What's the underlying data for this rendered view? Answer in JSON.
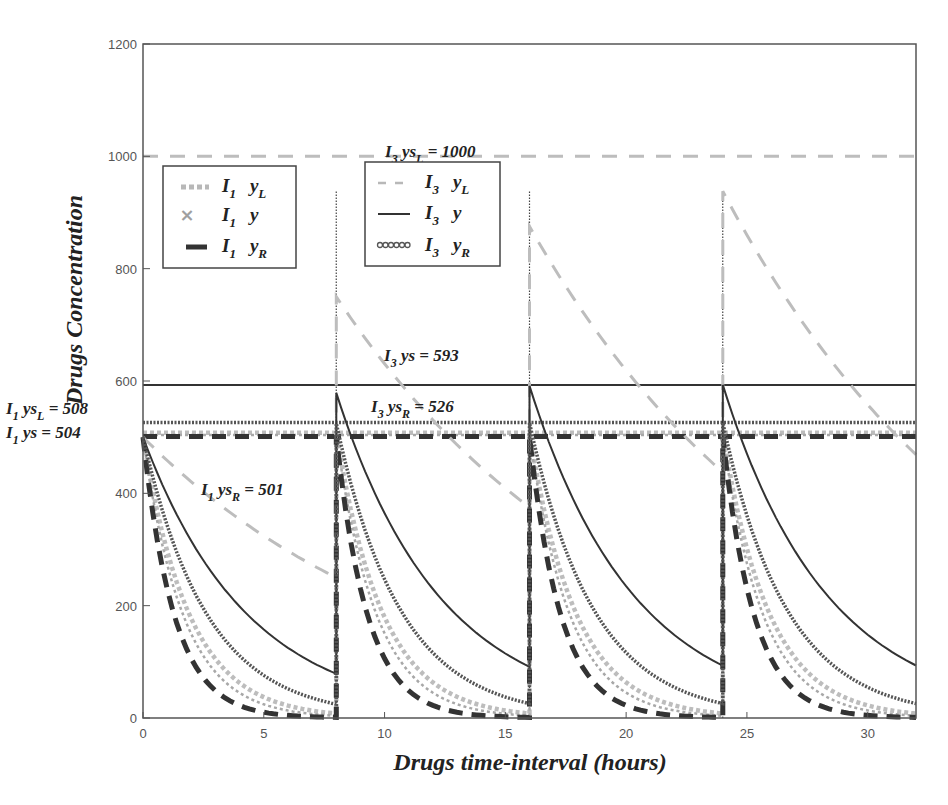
{
  "chart_data": {
    "type": "line",
    "title": "",
    "xlabel": "Drugs time-interval (hours)",
    "ylabel": "Drugs Concentration",
    "xlim": [
      0,
      32
    ],
    "ylim": [
      0,
      1200
    ],
    "xticks": [
      0,
      5,
      10,
      15,
      20,
      25,
      30
    ],
    "yticks": [
      0,
      200,
      400,
      600,
      800,
      1000,
      1200
    ],
    "grid": false,
    "dosing_times": [
      0,
      8,
      16,
      24
    ],
    "series": [
      {
        "name": "I1 yL",
        "style": "dotted-thick",
        "color": "#b8b8b8",
        "dose": 500,
        "k": 0.52,
        "steady_state": 508,
        "points": [
          [
            0,
            500
          ],
          [
            2,
            177
          ],
          [
            4,
            62
          ],
          [
            6,
            22
          ],
          [
            8,
            8
          ],
          [
            8,
            508
          ],
          [
            16,
            8
          ],
          [
            16,
            508
          ],
          [
            24,
            8
          ],
          [
            24,
            508
          ],
          [
            32,
            8
          ]
        ]
      },
      {
        "name": "I1 y",
        "style": "x-markers",
        "color": "#a0a0a0",
        "dose": 500,
        "k": 0.604,
        "steady_state": 504,
        "points": [
          [
            0,
            500
          ],
          [
            2,
            149
          ],
          [
            4,
            45
          ],
          [
            6,
            13
          ],
          [
            8,
            4
          ],
          [
            8,
            504
          ],
          [
            16,
            4
          ],
          [
            16,
            504
          ],
          [
            24,
            4
          ],
          [
            24,
            504
          ],
          [
            32,
            4
          ]
        ]
      },
      {
        "name": "I1 yR",
        "style": "dashed-thick",
        "color": "#333333",
        "dose": 500,
        "k": 0.777,
        "steady_state": 501,
        "points": [
          [
            0,
            500
          ],
          [
            2,
            106
          ],
          [
            4,
            22
          ],
          [
            6,
            5
          ],
          [
            8,
            1
          ],
          [
            8,
            501
          ],
          [
            16,
            1
          ],
          [
            16,
            501
          ],
          [
            24,
            1
          ],
          [
            24,
            501
          ],
          [
            32,
            1
          ]
        ]
      },
      {
        "name": "I3 yL",
        "style": "dashed",
        "color": "#b8b8b8",
        "dose": 500,
        "k": 0.0866,
        "steady_state": 1000,
        "points": [
          [
            0,
            500
          ],
          [
            8,
            250
          ],
          [
            8,
            750
          ],
          [
            16,
            375
          ],
          [
            16,
            875
          ],
          [
            24,
            438
          ],
          [
            24,
            938
          ],
          [
            32,
            469
          ]
        ]
      },
      {
        "name": "I3 y",
        "style": "solid",
        "color": "#333333",
        "dose": 500,
        "k": 0.231,
        "steady_state": 593,
        "points": [
          [
            0,
            500
          ],
          [
            4,
            198
          ],
          [
            8,
            79
          ],
          [
            8,
            579
          ],
          [
            16,
            91
          ],
          [
            16,
            591
          ],
          [
            24,
            93
          ],
          [
            24,
            593
          ],
          [
            32,
            93
          ]
        ]
      },
      {
        "name": "I3 yR",
        "style": "circle-markers",
        "color": "#555555",
        "dose": 500,
        "k": 0.377,
        "steady_state": 526,
        "points": [
          [
            0,
            500
          ],
          [
            4,
            111
          ],
          [
            8,
            24
          ],
          [
            8,
            524
          ],
          [
            16,
            26
          ],
          [
            16,
            526
          ],
          [
            24,
            26
          ],
          [
            24,
            526
          ],
          [
            32,
            26
          ]
        ]
      }
    ],
    "reference_lines": [
      {
        "label": "I3 ysL = 1000",
        "y": 1000,
        "style": "dashed",
        "color": "#b8b8b8"
      },
      {
        "label": "I3 ys = 593",
        "y": 593,
        "style": "solid",
        "color": "#333333"
      },
      {
        "label": "I3 ysR = 526",
        "y": 526,
        "style": "circle-markers",
        "color": "#555555"
      },
      {
        "label": "I1 ysL = 508",
        "y": 508,
        "style": "dotted-thick",
        "color": "#b8b8b8"
      },
      {
        "label": "I1 ys = 504",
        "y": 504,
        "style": "x-markers",
        "color": "#a0a0a0"
      },
      {
        "label": "I1 ysR = 501",
        "y": 501,
        "style": "dashed-thick",
        "color": "#333333"
      }
    ],
    "legends": [
      {
        "position": "upper-left",
        "entries": [
          "I1 yL",
          "I1 y",
          "I1 yR"
        ]
      },
      {
        "position": "upper-center",
        "entries": [
          "I3 yL",
          "I3 y",
          "I3 yR"
        ]
      }
    ]
  },
  "labels": {
    "xlabel": "Drugs time-interval (hours)",
    "ylabel": "Drugs Concentration"
  },
  "annotations": {
    "i3_ysl": {
      "main": "I",
      "sub": "3",
      "mid": " ys",
      "sub2": "L",
      "tail": " = 1000"
    },
    "i3_ys": {
      "main": "I",
      "sub": "3",
      "mid": " ys",
      "sub2": "",
      "tail": " = 593"
    },
    "i3_ysr": {
      "main": "I",
      "sub": "3",
      "mid": " ys",
      "sub2": "R",
      "tail": " = 526"
    },
    "i1_ysl": {
      "main": "I",
      "sub": "1",
      "mid": " ys",
      "sub2": "L",
      "tail": " = 508"
    },
    "i1_ys": {
      "main": "I",
      "sub": "1",
      "mid": " ys",
      "sub2": "",
      "tail": " = 504"
    },
    "i1_ysr": {
      "main": "I",
      "sub": "1",
      "mid": " ys",
      "sub2": "R",
      "tail": " = 501"
    }
  },
  "legend1": [
    {
      "I": "I",
      "sub": "1",
      "y": "y",
      "ysub": "L"
    },
    {
      "I": "I",
      "sub": "1",
      "y": "y",
      "ysub": ""
    },
    {
      "I": "I",
      "sub": "1",
      "y": "y",
      "ysub": "R"
    }
  ],
  "legend2": [
    {
      "I": "I",
      "sub": "3",
      "y": "y",
      "ysub": "L"
    },
    {
      "I": "I",
      "sub": "3",
      "y": "y",
      "ysub": ""
    },
    {
      "I": "I",
      "sub": "3",
      "y": "y",
      "ysub": "R"
    }
  ]
}
